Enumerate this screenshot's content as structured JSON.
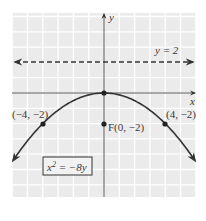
{
  "figure": {
    "type": "parabola-graph",
    "equation_label": "x² = −8y",
    "equation_base": "x",
    "equation_exp": "2",
    "equation_rest": " = −8y",
    "axes": {
      "x_label": "x",
      "y_label": "y"
    },
    "directrix": {
      "label": "y = 2",
      "y": 2,
      "style": "dashed"
    },
    "focus": {
      "label": "F(0, −2)",
      "x": 0,
      "y": -2
    },
    "vertex": {
      "x": 0,
      "y": 0
    },
    "points": [
      {
        "label": "(−4, −2)",
        "x": -4,
        "y": -2
      },
      {
        "label": "(4, −2)",
        "x": 4,
        "y": -2
      }
    ],
    "grid": {
      "x_range": [
        -6,
        6
      ],
      "y_range": [
        -6.8,
        5.3
      ],
      "step": 1
    },
    "colors": {
      "grid_bg": "#ebebeb",
      "grid_line": "#ffffff",
      "ink": "#333333",
      "axis": "#555555"
    }
  }
}
